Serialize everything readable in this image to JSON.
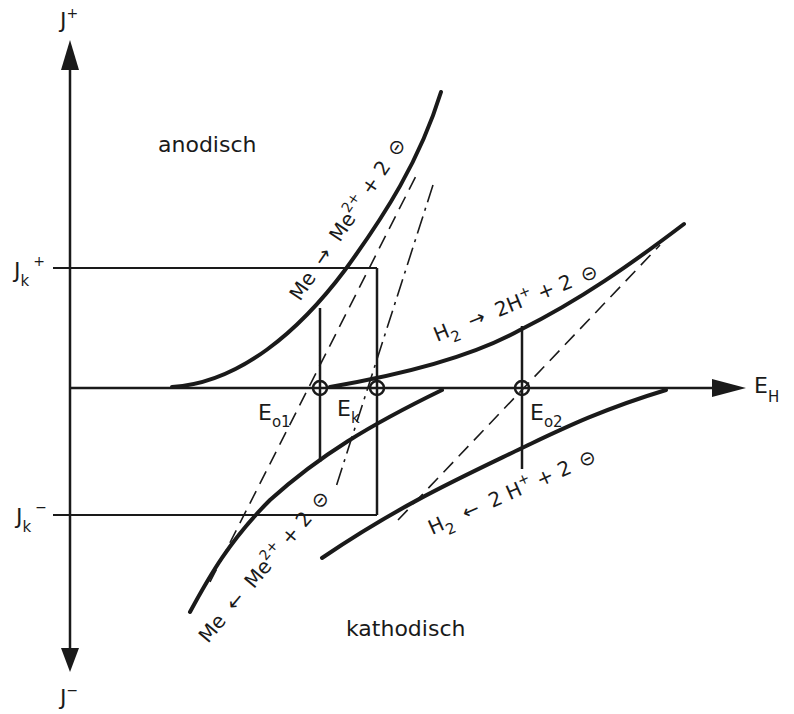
{
  "figure": {
    "type": "diagram",
    "title": "",
    "colors": {
      "ink": "#1a1a1a",
      "background": "#ffffff"
    }
  },
  "axes": {
    "y_axis": {
      "top_label": {
        "base": "J",
        "sup": "+"
      },
      "bottom_label": {
        "base": "J",
        "sup": "−"
      }
    },
    "x_axis": {
      "label": {
        "base": "E",
        "sub": "H"
      }
    }
  },
  "regions": {
    "upper": "anodisch",
    "lower": "kathodisch"
  },
  "levels": {
    "jk_plus": {
      "base": "J",
      "sub": "k",
      "sup": "+"
    },
    "jk_minus": {
      "base": "J",
      "sub": "k",
      "sup": "−"
    }
  },
  "points": {
    "eo1": {
      "base": "E",
      "sub": "o1"
    },
    "ek": {
      "base": "E",
      "sub": "k"
    },
    "eo2": {
      "base": "E",
      "sub": "o2"
    }
  },
  "reactions": {
    "metal_anodic": {
      "left": "Me",
      "arrow": "→",
      "right": "Me",
      "right_sup": "2+",
      "tail": " + 2",
      "electron": "⊝"
    },
    "hydrogen_anodic": {
      "left": "H",
      "left_sub": "2",
      "arrow": "→",
      "right": "2H",
      "right_sup": "+",
      "tail": " + 2",
      "electron": "⊝"
    },
    "metal_cathodic": {
      "left": "Me",
      "arrow": "←",
      "right": "Me",
      "right_sup": "2+",
      "tail": " + 2",
      "electron": "⊝"
    },
    "hydrogen_cathodic": {
      "left": "H",
      "left_sub": "2",
      "arrow": "←",
      "right": "2 H",
      "right_sup": "+",
      "tail": " + 2",
      "electron": "⊝"
    }
  }
}
